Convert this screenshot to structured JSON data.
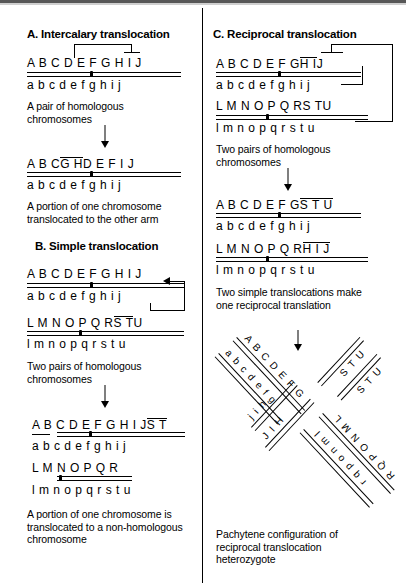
{
  "figure": {
    "title_a": "A. Intercalary translocation",
    "title_b": "B. Simple translocation",
    "title_c": "C. Reciprocal translocation"
  },
  "panel_a": {
    "title": "A. Intercalary translocation",
    "chrom1": {
      "upper": "A B C D E F G H I J",
      "lower": "a b c d e f g h i j"
    },
    "caption1": "A pair of homologous chromosomes",
    "chrom2": {
      "upper_pre": "A B C ",
      "upper_mark": "G H",
      "upper_post": " D E F I J",
      "lower": "a b c d e f g h i j"
    },
    "caption2": "A portion of one chromosome translocated to the other arm",
    "bracket_note": "bracket spans D through G with overline on G"
  },
  "panel_b": {
    "title": "B. Simple translocation",
    "chrom1": {
      "upper": "A B C D E F G H I J",
      "lower": "a b c d e f g h i j"
    },
    "chrom2": {
      "upper_pre": "L M N O P Q R ",
      "upper_mark": "S T",
      "upper_post": " U",
      "lower": "l m n o p q r s t u"
    },
    "caption1": "Two pairs of homologous chromosomes",
    "result1": {
      "upper_pre": "A B C D E F G H I J ",
      "upper_mark": "S T",
      "upper_post": "",
      "lower": "a b c d e f g h i j"
    },
    "result2": {
      "upper": "L M N O P Q R",
      "lower": "l m n o p q r s t u"
    },
    "caption2": "A portion of one chromosome is translocated to a non-homologous chromosome"
  },
  "panel_c": {
    "title": "C. Reciprocal translocation",
    "chrom1": {
      "upper_pre": "A B C D E F G ",
      "upper_mark": "H I",
      "upper_post": " J",
      "lower": "a b c d e f g h i j"
    },
    "chrom2": {
      "upper_pre": "L M N O P Q R ",
      "upper_mark": "S T",
      "upper_post": " U",
      "lower": "l m n o p q r s t u"
    },
    "caption1": "Two pairs of homologous chromosomes",
    "result1": {
      "upper_pre": "A B C D E F G ",
      "upper_mark": "S T U",
      "upper_post": "",
      "lower": "a b c d e f g h i j"
    },
    "result2": {
      "upper_pre": "L M N O P Q R ",
      "upper_mark": "H I J",
      "upper_post": "",
      "lower": "l m n o p q r s t u"
    },
    "caption2": "Two simple translocations make one reciprocal translation",
    "caption3": "Pachytene configuration of reciprocal translocation heterozygote"
  },
  "cross": {
    "arm_top_left_upper": "A B C D E F G",
    "arm_top_left_lower": "a b c d e f g",
    "arm_top_right_outer": "S T U",
    "arm_top_right_inner": "S T U",
    "arm_bottom_right_outer": "R Q P O N M L",
    "arm_bottom_right_inner": "r q p o n m l",
    "arm_bottom_left_upper": "J I H",
    "arm_bottom_left_lower": "j i h"
  }
}
